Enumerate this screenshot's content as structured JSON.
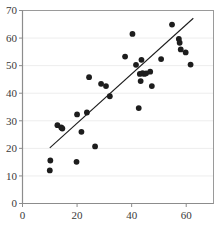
{
  "chart_data": {
    "type": "scatter",
    "title": "",
    "subtitle": "",
    "xlabel": "",
    "ylabel": "",
    "xlim": [
      0,
      70
    ],
    "ylim": [
      0,
      70
    ],
    "xticks": [
      0,
      20,
      40,
      60
    ],
    "yticks": [
      0,
      10,
      20,
      30,
      40,
      50,
      60,
      70
    ],
    "xtick_labels": [
      "0",
      "20",
      "40",
      "60"
    ],
    "ytick_labels": [
      "0",
      "10",
      "20",
      "30",
      "40",
      "50",
      "60",
      "70"
    ],
    "grid": "horizontal",
    "legend": "none",
    "annotations": [],
    "series": [
      {
        "name": "observations",
        "type": "scatter",
        "marker": "filled-circle",
        "color": "#1d1d1d",
        "points": [
          [
            10.0,
            12.0
          ],
          [
            10.2,
            15.6
          ],
          [
            12.8,
            28.4
          ],
          [
            14.2,
            27.6
          ],
          [
            14.6,
            27.2
          ],
          [
            19.8,
            15.1
          ],
          [
            20.0,
            32.3
          ],
          [
            21.6,
            26.0
          ],
          [
            23.6,
            33.0
          ],
          [
            24.4,
            45.8
          ],
          [
            26.6,
            20.7
          ],
          [
            28.8,
            43.4
          ],
          [
            30.6,
            42.6
          ],
          [
            32.0,
            38.9
          ],
          [
            37.6,
            53.3
          ],
          [
            40.3,
            61.5
          ],
          [
            41.6,
            50.3
          ],
          [
            42.6,
            34.6
          ],
          [
            43.0,
            47.0
          ],
          [
            43.3,
            44.4
          ],
          [
            43.6,
            52.1
          ],
          [
            44.0,
            47.3
          ],
          [
            44.6,
            47.0
          ],
          [
            45.3,
            47.2
          ],
          [
            46.8,
            47.8
          ],
          [
            47.4,
            42.6
          ],
          [
            50.8,
            52.4
          ],
          [
            54.8,
            64.9
          ],
          [
            57.3,
            59.7
          ],
          [
            57.6,
            58.3
          ],
          [
            58.0,
            55.9
          ],
          [
            59.8,
            54.8
          ],
          [
            61.6,
            50.4
          ]
        ]
      },
      {
        "name": "regression-line",
        "type": "line",
        "color": "#1d1d1d",
        "points": [
          [
            10.0,
            20.2
          ],
          [
            62.6,
            67.2
          ]
        ]
      }
    ]
  },
  "axes": {
    "axis_color": "#9a9a9a",
    "grid_color": "#ededed",
    "frame": "box"
  }
}
